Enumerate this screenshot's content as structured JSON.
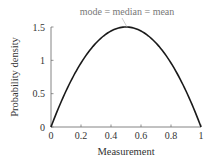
{
  "chart_data": {
    "type": "line",
    "title": "",
    "annotation": "mode = median = mean",
    "xlabel": "Measurement",
    "ylabel": "Probability density",
    "xlim": [
      0,
      1
    ],
    "ylim": [
      0,
      1.5
    ],
    "xticks": [
      "0",
      "0.2",
      "0.4",
      "0.6",
      "0.8",
      "1"
    ],
    "yticks": [
      "0",
      "0.5",
      "1",
      "1.5"
    ],
    "grid": false,
    "legend": null,
    "series": [
      {
        "name": "density",
        "x": [
          0,
          0.1,
          0.2,
          0.3,
          0.4,
          0.5,
          0.6,
          0.7,
          0.8,
          0.9,
          1.0
        ],
        "y": [
          0,
          0.54,
          0.96,
          1.26,
          1.44,
          1.5,
          1.44,
          1.26,
          0.96,
          0.54,
          0
        ]
      }
    ],
    "colors": {
      "line": "#1a1a1a",
      "axis": "#555555",
      "text": "#333333",
      "annotation": "#777777"
    }
  }
}
